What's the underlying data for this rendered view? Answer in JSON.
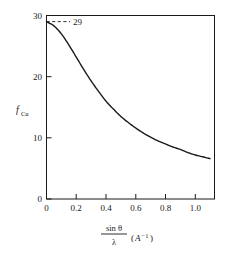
{
  "chart_data": {
    "type": "line",
    "title": "",
    "xlabel": "sin θ / λ (A⁻¹)",
    "ylabel": "f_Cu",
    "xlim": [
      0,
      1.13
    ],
    "ylim": [
      0,
      30
    ],
    "grid": false,
    "legend": "none",
    "x_ticks": [
      "0",
      "0.2",
      "0.4",
      "0.6",
      "0.8",
      "1.0"
    ],
    "x_tick_values": [
      0,
      0.2,
      0.4,
      0.6,
      0.8,
      1.0
    ],
    "y_ticks": [
      "0",
      "10",
      "20",
      "30"
    ],
    "y_tick_values": [
      0,
      10,
      20,
      30
    ],
    "series": [
      {
        "name": "f_Cu",
        "x": [
          0.0,
          0.05,
          0.1,
          0.15,
          0.2,
          0.25,
          0.3,
          0.35,
          0.4,
          0.45,
          0.5,
          0.55,
          0.6,
          0.65,
          0.7,
          0.75,
          0.8,
          0.85,
          0.9,
          0.95,
          1.0,
          1.05,
          1.1
        ],
        "values": [
          29.0,
          28.3,
          27.0,
          25.2,
          23.2,
          21.2,
          19.3,
          17.6,
          16.0,
          14.7,
          13.5,
          12.5,
          11.6,
          10.8,
          10.1,
          9.5,
          9.0,
          8.5,
          8.1,
          7.6,
          7.2,
          6.9,
          6.6
        ]
      }
    ],
    "annotations": [
      {
        "name": "value-29-annotation",
        "label": "29",
        "x": 0.0,
        "y": 29.0,
        "style": "dashed-leader-line"
      }
    ]
  },
  "axis_labels": {
    "x_numerator": "sin θ",
    "x_denominator": "λ",
    "x_unit_open": "(",
    "x_unit_symbol": "A",
    "x_unit_exp": "−1",
    "x_unit_close": ")",
    "y_symbol": "f",
    "y_subscript": "Cu"
  },
  "colors": {
    "curve": "#1a1a1a",
    "axis": "#1a1a1a",
    "text": "#1a1a1a",
    "background": "#ffffff",
    "annotation": "#1a1a1a"
  }
}
